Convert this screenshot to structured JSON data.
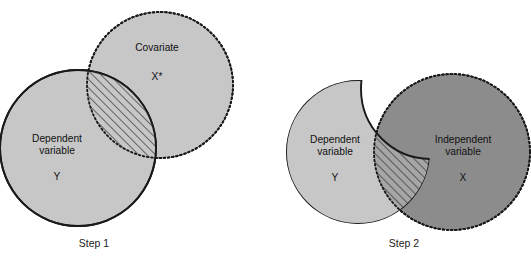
{
  "figure": {
    "background_color": "#ffffff",
    "colors": {
      "light_gray_fill": "#c7c7c7",
      "dark_gray_fill": "#8c8c8c",
      "outline": "#1a1a1a",
      "hatch_line": "#2b2b2b",
      "text": "#111111",
      "white": "#ffffff"
    }
  },
  "panels": [
    {
      "id": "step1",
      "caption": "Step 1",
      "caption_x": 94,
      "caption_y": 247,
      "shapes": [
        {
          "name": "dependent-variable-circle",
          "label_lines": [
            "Dependent",
            "variable"
          ],
          "symbol": "Y",
          "border_style": "solid",
          "fill": "#c7c7c7",
          "cx": 78,
          "cy": 148,
          "r": 78,
          "label_x": 57,
          "label_y": 142,
          "symbol_x": 57,
          "symbol_y": 176
        },
        {
          "name": "covariate-circle",
          "label_lines": [
            "Covariate"
          ],
          "symbol": "X*",
          "border_style": "dotted",
          "fill": "#c7c7c7",
          "cx": 160,
          "cy": 85,
          "r": 73,
          "label_x": 157,
          "label_y": 51,
          "symbol_x": 157,
          "symbol_y": 80
        }
      ],
      "hatched_region": {
        "name": "shared-variance-lens",
        "description": "Overlap of dependent variable Y and covariate X*, hatched"
      }
    },
    {
      "id": "step2",
      "caption": "Step 2",
      "caption_x": 404,
      "caption_y": 247,
      "shapes": [
        {
          "name": "dependent-variable-shape",
          "label_lines": [
            "Dependent",
            "variable"
          ],
          "symbol": "Y",
          "border_style": "solid",
          "fill": "#c7c7c7",
          "cx": 358,
          "cy": 152,
          "r": 72,
          "label_x": 335,
          "label_y": 143,
          "symbol_x": 335,
          "symbol_y": 175,
          "note": "upper-right crescent removed (variance explained by covariate in Step 1)"
        },
        {
          "name": "independent-variable-circle",
          "label_lines": [
            "Independent",
            "variable"
          ],
          "symbol": "X",
          "border_style": "dotted",
          "fill": "#8c8c8c",
          "cx": 452,
          "cy": 152,
          "r": 78,
          "label_x": 463,
          "label_y": 143,
          "symbol_x": 463,
          "symbol_y": 177
        }
      ],
      "hatched_region": {
        "name": "shared-variance-lens",
        "description": "Lower overlap of remaining Y and independent variable X, hatched"
      }
    }
  ]
}
